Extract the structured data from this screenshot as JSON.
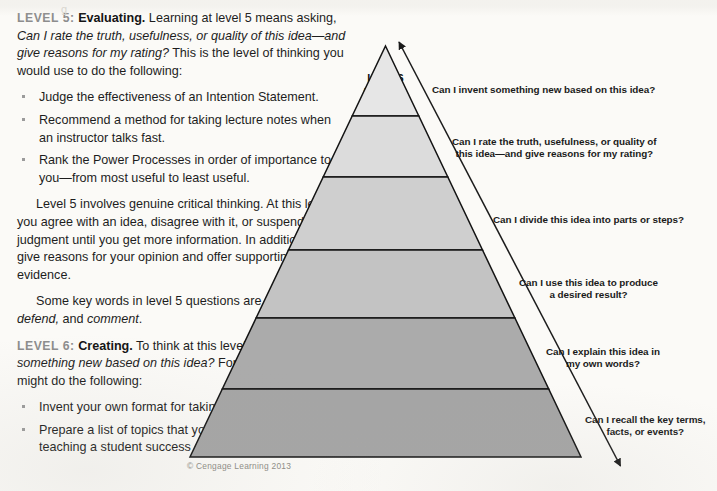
{
  "page": {
    "background": "#fbfaf7",
    "ghost_text": "g",
    "credit": "© Cengage Learning 2013"
  },
  "article": {
    "level5": {
      "eyebrow": "LEVEL 5:",
      "heading": "Evaluating.",
      "intro_a": " Learning at level 5 means asking, ",
      "intro_italic": "Can I rate the truth, usefulness, or quality of this idea—and give reasons for my rating?",
      "intro_b": " This is the level of thinking you would use to do the following:",
      "bullets": [
        "Judge the effectiveness of an Intention Statement.",
        "Recommend a method for taking lecture notes when an instructor talks fast.",
        "Rank the Power Processes in order of importance to you—from most useful to least useful."
      ],
      "para_1": "Level 5 involves genuine critical thinking. At this level you agree with an idea, disagree with it, or suspend judgment until you get more information. In addition, you give reasons for your opinion and offer supporting evidence.",
      "para_2_a": "Some key words in level 5 questions are ",
      "para_2_italic_1": "critique, defend,",
      "para_2_b": " and ",
      "para_2_italic_2": "comment",
      "para_2_c": "."
    },
    "level6": {
      "eyebrow": "LEVEL 6:",
      "heading": "Creating.",
      "intro_a": " To think at this level, ask, ",
      "intro_italic": "Can I invent something new based on this idea?",
      "intro_b": " For instance, you might do the following:",
      "bullets": [
        "Invent your own format for taking lecture notes.",
        "Prepare a list of topics that you would cover if you were teaching a student success course."
      ]
    }
  },
  "chart_data": {
    "type": "pyramid",
    "orientation": "apex-up",
    "axis_arrow": "double-headed arrow along right edge indicating progression from Level 1 at base to Level 6 at apex",
    "levels": [
      {
        "rank": 6,
        "number": "Level 6",
        "name": "Creating",
        "fill": "#e6e6e6",
        "question": "Can I invent something new based on this idea?"
      },
      {
        "rank": 5,
        "number": "Level 5",
        "name": "Evaluating",
        "fill": "#dcdcdc",
        "question": "Can I rate the truth, usefulness, or quality of\nthis idea—and give reasons for my rating?"
      },
      {
        "rank": 4,
        "number": "Level 4",
        "name": "Analyzing",
        "fill": "#cfcfcf",
        "question": "Can I divide this idea into parts or steps?"
      },
      {
        "rank": 3,
        "number": "Level 3",
        "name": "Applying",
        "fill": "#c3c3c3",
        "question": "Can I use this idea to produce\na desired result?"
      },
      {
        "rank": 2,
        "number": "Level 2",
        "name": "Understanding",
        "fill": "#ababab",
        "question": "Can I explain this idea in\nmy own words?"
      },
      {
        "rank": 1,
        "number": "Level 1",
        "name": "Remembering",
        "fill": "#a5a5a5",
        "question": "Can I recall the key terms,\nfacts, or events?"
      }
    ]
  }
}
